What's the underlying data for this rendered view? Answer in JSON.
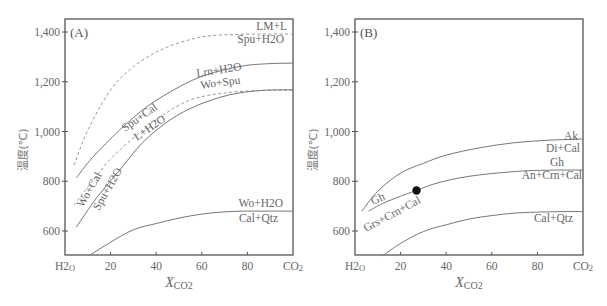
{
  "chart_data": [
    {
      "type": "line",
      "panel": "(A)",
      "xlabel": "XCO2",
      "ylabel": "温度(℃)",
      "xlim": [
        0,
        100
      ],
      "ylim": [
        500,
        1450
      ],
      "x_ticks": [
        {
          "value": 0,
          "label": "H2O"
        },
        {
          "value": 20,
          "label": "20"
        },
        {
          "value": 40,
          "label": "40"
        },
        {
          "value": 60,
          "label": "60"
        },
        {
          "value": 80,
          "label": "80"
        },
        {
          "value": 100,
          "label": "CO2"
        }
      ],
      "y_ticks": [
        {
          "value": 600,
          "label": "600"
        },
        {
          "value": 800,
          "label": "800"
        },
        {
          "value": 1000,
          "label": "1,000"
        },
        {
          "value": 1200,
          "label": "1,200"
        },
        {
          "value": 1400,
          "label": "1,400"
        }
      ],
      "grid": false,
      "series": [
        {
          "name": "LM+L / Spu+H2O",
          "style": "dashed",
          "label_upper": "LM+L",
          "label_lower": "Spu+H2O",
          "x": [
            4,
            10,
            20,
            30,
            42,
            55,
            64,
            75,
            88,
            100
          ],
          "y": [
            865,
            1005,
            1167,
            1260,
            1328,
            1370,
            1385,
            1390,
            1392,
            1392
          ]
        },
        {
          "name": "Lrn+H2O / Wo+Spu",
          "style": "solid",
          "label_upper": "Lrn+H2O",
          "label_lower": "Wo+Spu",
          "x": [
            5,
            12,
            24,
            36,
            50,
            62,
            77,
            88,
            100
          ],
          "y": [
            813,
            895,
            1006,
            1100,
            1179,
            1228,
            1262,
            1272,
            1275
          ]
        },
        {
          "name": "Wo+Cal / Spu+Cal",
          "style": "dashed",
          "label_upper": "Spu+Cal",
          "label_lower": "Wo+Cal",
          "x": [
            4,
            12,
            20,
            29,
            42,
            55,
            70,
            86,
            100
          ],
          "y": [
            705,
            800,
            890,
            966,
            1060,
            1127,
            1155,
            1165,
            1165
          ]
        },
        {
          "name": "Spu+H2O / L+H2O",
          "style": "solid",
          "label_upper": "L+H2O",
          "label_lower": "Spu+H2O",
          "x": [
            5,
            14,
            24,
            34,
            46,
            58,
            72,
            86,
            100
          ],
          "y": [
            616,
            735,
            845,
            955,
            1046,
            1105,
            1147,
            1165,
            1168
          ]
        },
        {
          "name": "Wo+H2O / Cal+Qtz",
          "style": "solid",
          "label_upper": "Wo+H2O",
          "label_lower": "Cal+Qtz",
          "x": [
            11,
            20,
            30,
            40,
            50,
            60,
            70,
            80,
            90,
            100
          ],
          "y": [
            503,
            555,
            605,
            630,
            652,
            668,
            677,
            680,
            680,
            680
          ]
        }
      ]
    },
    {
      "type": "line",
      "panel": "(B)",
      "xlabel": "XCO2",
      "ylabel": "温度(℃)",
      "xlim": [
        0,
        100
      ],
      "ylim": [
        500,
        1450
      ],
      "x_ticks": [
        {
          "value": 0,
          "label": "H2O"
        },
        {
          "value": 20,
          "label": "20"
        },
        {
          "value": 40,
          "label": "40"
        },
        {
          "value": 60,
          "label": "60"
        },
        {
          "value": 80,
          "label": "80"
        },
        {
          "value": 100,
          "label": "CO2"
        }
      ],
      "y_ticks": [
        {
          "value": 600,
          "label": "600"
        },
        {
          "value": 800,
          "label": "800"
        },
        {
          "value": 1000,
          "label": "1,000"
        },
        {
          "value": 1200,
          "label": "1,200"
        },
        {
          "value": 1400,
          "label": "1,400"
        }
      ],
      "grid": false,
      "series": [
        {
          "name": "Ak / Di+Cal",
          "style": "solid",
          "label_upper": "Ak",
          "label_lower": "Di+Cal",
          "x": [
            3,
            10,
            20,
            30,
            40,
            55,
            70,
            85,
            100
          ],
          "y": [
            680,
            760,
            833,
            872,
            905,
            935,
            955,
            965,
            970
          ]
        },
        {
          "name": "Gh / Grs+Crn+Cal (left)",
          "style": "solid",
          "label_upper": "Gh",
          "label_lower": "Grs+Crn+Cal",
          "x": [
            6,
            12,
            20,
            27
          ],
          "y": [
            680,
            710,
            740,
            763
          ]
        },
        {
          "name": "Gh / An+Crn+Cal",
          "style": "solid",
          "label_upper": "Gh",
          "label_lower": "An+Crn+Cal",
          "x": [
            27,
            35,
            45,
            55,
            65,
            75,
            88,
            100
          ],
          "y": [
            763,
            790,
            812,
            826,
            835,
            842,
            845,
            845
          ]
        },
        {
          "name": "Cal+Qtz",
          "style": "solid",
          "label_upper": "",
          "label_lower": "Cal+Qtz",
          "x": [
            12,
            20,
            30,
            40,
            50,
            60,
            70,
            80,
            90,
            100
          ],
          "y": [
            500,
            550,
            598,
            625,
            648,
            662,
            672,
            676,
            678,
            678
          ]
        }
      ],
      "points": [
        {
          "x": 27,
          "y": 763,
          "label": "invariant point"
        }
      ]
    }
  ],
  "panels": {
    "a": {
      "label": "(A)"
    },
    "b": {
      "label": "(B)"
    }
  },
  "axis": {
    "ylabel": "温度(℃)",
    "xlabel_main": "X",
    "xlabel_sub": "CO2"
  },
  "labels_a": {
    "lm_l": "LM+L",
    "spu_h2o_top": "Spu+H2O",
    "lrn_h2o": "Lrn+H2O",
    "wo_spu": "Wo+Spu",
    "spu_cal": "Spu+Cal",
    "l_h2o": "L+H2O",
    "wo_cal": "Wo+Cal",
    "spu_h2o_left": "Spu+H2O",
    "wo_h2o": "Wo+H2O",
    "cal_qtz": "Cal+Qtz"
  },
  "labels_b": {
    "ak": "Ak",
    "di_cal": "Di+Cal",
    "gh_right": "Gh",
    "an_crn_cal": "An+Crn+Cal",
    "gh_left": "Gh",
    "grs_crn_cal": "Grs+Crn+Cal",
    "cal_qtz": "Cal+Qtz"
  }
}
